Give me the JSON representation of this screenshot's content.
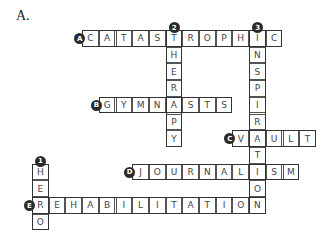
{
  "heading": "A.",
  "grid": {
    "origin_x": 32,
    "origin_y": 30,
    "cell": 16.7
  },
  "words": [
    {
      "label": "A",
      "dir": "across",
      "answer": "CATASTROPHIC",
      "col": 3,
      "row": 0
    },
    {
      "label": "B",
      "dir": "across",
      "answer": "GYMNASTS",
      "col": 4,
      "row": 4
    },
    {
      "label": "C",
      "dir": "across",
      "answer": "VAULT",
      "col": 12,
      "row": 6
    },
    {
      "label": "D",
      "dir": "across",
      "answer": "JOURNALISM",
      "col": 6,
      "row": 8
    },
    {
      "label": "E",
      "dir": "across",
      "answer": "REHABILITATION",
      "col": 0,
      "row": 10
    },
    {
      "label": "1",
      "dir": "down",
      "answer": "HERO",
      "col": 0,
      "row": 8
    },
    {
      "label": "2",
      "dir": "down",
      "answer": "THERAPY",
      "col": 8,
      "row": 0
    },
    {
      "label": "3",
      "dir": "down",
      "answer": "INSPIRATION",
      "col": 13,
      "row": 0
    }
  ],
  "colors": {
    "border": "#555555",
    "badge": "#2a2a2a",
    "letter": "#444444"
  }
}
